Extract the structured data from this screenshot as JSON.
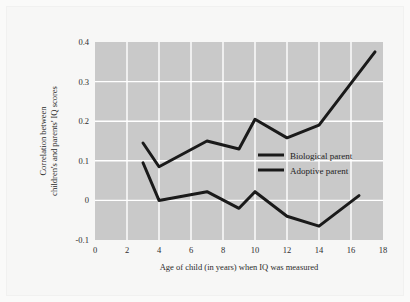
{
  "chart_data": {
    "type": "line",
    "title": "",
    "subtitle": "",
    "xlabel": "Age of child (in years) when IQ was measured",
    "ylabel": "Correlation between children's and parents' IQ scores",
    "ylabel_line1": "Correlation between",
    "ylabel_line2": "children's and parents' IQ scores",
    "xlim": [
      0,
      18
    ],
    "ylim": [
      -0.1,
      0.4
    ],
    "xticks": [
      0,
      2,
      4,
      6,
      8,
      10,
      12,
      14,
      16,
      18
    ],
    "xtick_labels": [
      "0",
      "2",
      "4",
      "6",
      "8",
      "10",
      "12",
      "14",
      "16",
      "18"
    ],
    "yticks": [
      -0.1,
      0,
      0.1,
      0.2,
      0.3,
      0.4
    ],
    "ytick_labels": [
      "-0.1",
      "0",
      "0.1",
      "0.2",
      "0.3",
      "0.4"
    ],
    "grid": true,
    "grid_color": "#ffffff",
    "plot_background": "#c9c9c9",
    "legend_position": "center-right",
    "series": [
      {
        "name": "Biological parent",
        "color": "#1a1a1a",
        "points": [
          [
            3,
            0.145
          ],
          [
            4,
            0.085
          ],
          [
            7,
            0.15
          ],
          [
            9,
            0.13
          ],
          [
            10,
            0.205
          ],
          [
            12,
            0.158
          ],
          [
            14,
            0.19
          ],
          [
            17.5,
            0.375
          ]
        ]
      },
      {
        "name": "Adoptive parent",
        "color": "#1a1a1a",
        "points": [
          [
            3,
            0.095
          ],
          [
            4,
            0.0
          ],
          [
            7,
            0.022
          ],
          [
            9,
            -0.02
          ],
          [
            10,
            0.022
          ],
          [
            12,
            -0.04
          ],
          [
            14,
            -0.065
          ],
          [
            16.5,
            0.012
          ]
        ]
      }
    ]
  },
  "legend": {
    "items": [
      {
        "label": "Biological parent"
      },
      {
        "label": "Adoptive parent"
      }
    ]
  }
}
